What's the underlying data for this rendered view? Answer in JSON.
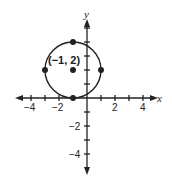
{
  "diagram": {
    "type": "coordinate-plane-circle",
    "axes": {
      "x_label": "x",
      "y_label": "y",
      "x_ticks": [
        "−4",
        "−2",
        "2",
        "4"
      ],
      "y_ticks": [
        "−2",
        "−4"
      ],
      "range_x": [
        -5,
        5
      ],
      "range_y": [
        -5,
        5
      ]
    },
    "circle": {
      "center": [
        -1,
        2
      ],
      "radius": 2,
      "center_label": "(−1, 2)"
    },
    "points": [
      {
        "x": -1,
        "y": 4
      },
      {
        "x": -3,
        "y": 2
      },
      {
        "x": 1,
        "y": 2
      },
      {
        "x": -1,
        "y": 0
      },
      {
        "x": -1,
        "y": 2
      }
    ],
    "colors": {
      "ink": "#222222",
      "background": "#ffffff"
    }
  }
}
